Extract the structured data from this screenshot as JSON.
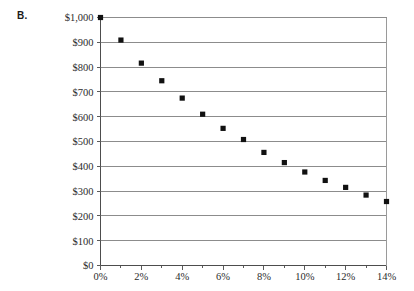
{
  "panel": {
    "label": "B."
  },
  "chart_data": {
    "type": "scatter",
    "title": "",
    "subtitle": "",
    "xlabel": "",
    "ylabel": "",
    "grid": "horizontal",
    "legend": "none",
    "marker": "square",
    "marker_color": "#111111",
    "xlim": [
      0,
      14
    ],
    "ylim": [
      0,
      1000
    ],
    "x_tick_labels": [
      "0%",
      "2%",
      "4%",
      "6%",
      "8%",
      "10%",
      "12%",
      "14%"
    ],
    "x_tick_values": [
      0,
      2,
      4,
      6,
      8,
      10,
      12,
      14
    ],
    "x_minor_tick_values": [
      1,
      3,
      5,
      7,
      9,
      11,
      13
    ],
    "y_tick_labels": [
      "$0",
      "$100",
      "$200",
      "$300",
      "$400",
      "$500",
      "$600",
      "$700",
      "$800",
      "$900",
      "$1,000"
    ],
    "y_tick_values": [
      0,
      100,
      200,
      300,
      400,
      500,
      600,
      700,
      800,
      900,
      1000
    ],
    "x": [
      0,
      1,
      2,
      3,
      4,
      5,
      6,
      7,
      8,
      9,
      10,
      11,
      12,
      13,
      14
    ],
    "values": [
      1000,
      909,
      816,
      745,
      675,
      610,
      553,
      508,
      456,
      415,
      377,
      343,
      315,
      284,
      258
    ],
    "series": [
      {
        "name": "price",
        "x": [
          0,
          1,
          2,
          3,
          4,
          5,
          6,
          7,
          8,
          9,
          10,
          11,
          12,
          13,
          14
        ],
        "values": [
          1000,
          909,
          816,
          745,
          675,
          610,
          553,
          508,
          456,
          415,
          377,
          343,
          315,
          284,
          258
        ]
      }
    ]
  },
  "colors": {
    "marker": "#111111",
    "gridline": "#8c8c8c",
    "axis": "#4d4d4d",
    "text": "#2b2b2b",
    "background": "#ffffff"
  }
}
